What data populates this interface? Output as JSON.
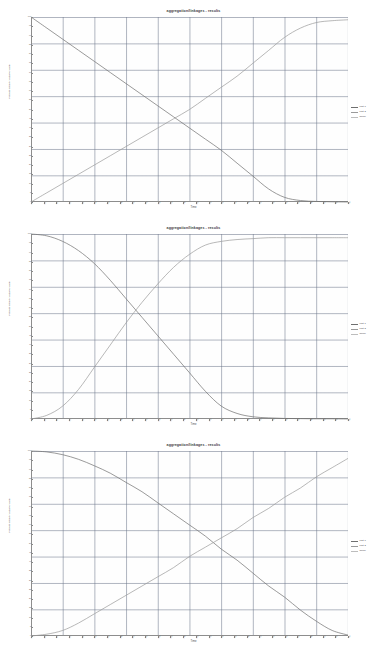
{
  "page": {
    "background": "#ffffff",
    "chart_count": 3
  },
  "common": {
    "title": "aggregation/linkages - results",
    "xlabel": "Time",
    "ylabel": "Process Count / Variable Value",
    "legend": [
      {
        "label": "part 1",
        "color": "#6f6f6f"
      },
      {
        "label": "part 2",
        "color": "#9a9a9a"
      },
      {
        "label": "whole",
        "color": "#bdbdbd"
      }
    ],
    "xticks": [
      "0",
      "20",
      "40",
      "60",
      "80",
      "100",
      "120",
      "140",
      "160",
      "180",
      "200",
      "220",
      "240",
      "260",
      "280",
      "300",
      "320",
      "340",
      "360",
      "380",
      "400",
      "420",
      "440",
      "460",
      "480",
      "500"
    ],
    "yticks": [
      "100",
      "95",
      "90",
      "85",
      "80",
      "75",
      "70",
      "65",
      "60",
      "55",
      "50",
      "45",
      "40",
      "35",
      "30",
      "25",
      "20",
      "15",
      "10",
      "5",
      "0"
    ]
  },
  "chart_data": [
    {
      "type": "line",
      "title": "aggregation/linkages - results",
      "xlabel": "Time",
      "ylabel": "Process Count / Variable Value",
      "xlim": [
        0,
        500
      ],
      "ylim": [
        0,
        100
      ],
      "grid": true,
      "legend_position": "right",
      "x": [
        0,
        25,
        50,
        75,
        100,
        125,
        150,
        175,
        200,
        225,
        250,
        275,
        300,
        325,
        350,
        375,
        400,
        425,
        450,
        475,
        500
      ],
      "series": [
        {
          "name": "part 1",
          "color": "#6f6f6f",
          "values": [
            100,
            94,
            88,
            82,
            76,
            70,
            64,
            58,
            52,
            46,
            40,
            34,
            28,
            21,
            14,
            7,
            2.5,
            0.8,
            0.3,
            0.1,
            0.0
          ]
        },
        {
          "name": "part 2",
          "color": "#9a9a9a",
          "values": [
            0,
            5,
            10,
            15,
            20,
            25,
            30,
            35,
            40,
            45,
            50,
            56,
            62,
            68,
            75,
            82,
            89,
            94,
            97,
            98,
            98.5
          ]
        }
      ]
    },
    {
      "type": "line",
      "title": "aggregation/linkages - results",
      "xlabel": "Time",
      "ylabel": "Process Count / Variable Value",
      "xlim": [
        0,
        500
      ],
      "ylim": [
        0,
        100
      ],
      "grid": true,
      "legend_position": "right",
      "x": [
        0,
        25,
        50,
        75,
        100,
        125,
        150,
        175,
        200,
        225,
        250,
        275,
        300,
        325,
        350,
        375,
        400,
        425,
        450,
        475,
        500
      ],
      "series": [
        {
          "name": "part 1",
          "color": "#6f6f6f",
          "values": [
            100,
            99,
            96,
            91,
            84,
            75,
            65,
            55,
            45,
            35,
            25,
            15,
            7,
            3,
            1.2,
            0.6,
            0.3,
            0.2,
            0.1,
            0.1,
            0.0
          ]
        },
        {
          "name": "part 2",
          "color": "#9a9a9a",
          "values": [
            0,
            2,
            7,
            16,
            28,
            40,
            52,
            63,
            73,
            82,
            89,
            94,
            96,
            97,
            97.5,
            98,
            98,
            98,
            98,
            98,
            98
          ]
        }
      ]
    },
    {
      "type": "line",
      "title": "aggregation/linkages - results",
      "xlabel": "Time",
      "ylabel": "Process Count / Variable Value",
      "xlim": [
        0,
        500
      ],
      "ylim": [
        0,
        100
      ],
      "grid": true,
      "legend_position": "right",
      "x": [
        0,
        25,
        50,
        75,
        100,
        125,
        150,
        175,
        200,
        225,
        250,
        275,
        300,
        325,
        350,
        375,
        400,
        425,
        450,
        475,
        500
      ],
      "series": [
        {
          "name": "part 1",
          "color": "#6f6f6f",
          "values": [
            100,
            99.5,
            98,
            95.5,
            92,
            88,
            83,
            78,
            72,
            66,
            60,
            54,
            47,
            41,
            34,
            27,
            21,
            14,
            8,
            3,
            0.5
          ]
        },
        {
          "name": "part 2",
          "color": "#9a9a9a",
          "values": [
            0,
            1,
            3,
            7,
            12,
            17,
            22,
            27,
            32,
            37,
            43,
            48,
            53,
            58,
            64,
            69,
            75,
            80,
            86,
            91,
            96
          ]
        }
      ]
    }
  ]
}
